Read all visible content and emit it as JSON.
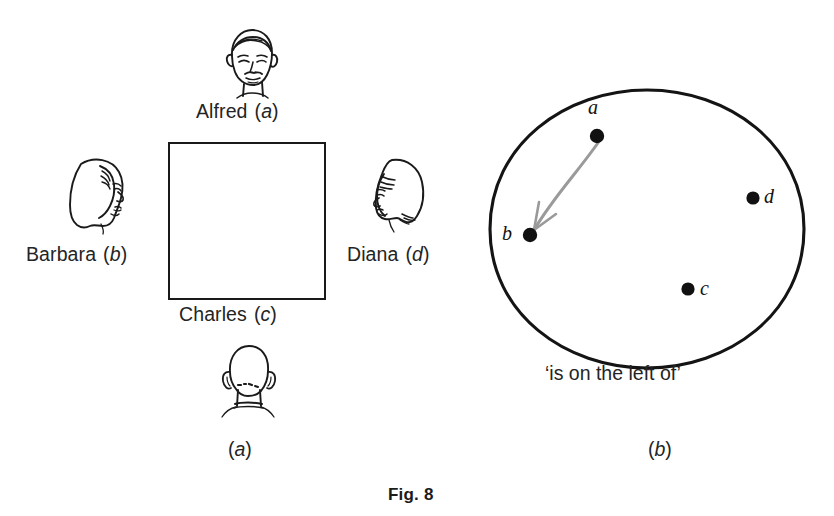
{
  "figure": {
    "caption": "Fig. 8",
    "panels": [
      {
        "id": "a",
        "letter": "(a)",
        "open_paren": "(",
        "symbol": "a",
        "close_paren": ")"
      },
      {
        "id": "b",
        "letter": "(b)",
        "open_paren": "(",
        "symbol": "b",
        "close_paren": ")"
      }
    ]
  },
  "panel_a": {
    "description": "four people seated around a square table",
    "table_shape": "square",
    "people": [
      {
        "name": "Alfred",
        "symbol": "a",
        "seat": "top",
        "name_text": "Alfred",
        "paren_open": "(",
        "paren_close": ")",
        "portrait": "face-front-male-icon"
      },
      {
        "name": "Barbara",
        "symbol": "b",
        "seat": "left",
        "name_text": "Barbara",
        "paren_open": "(",
        "paren_close": ")",
        "portrait": "face-profile-right-female-icon"
      },
      {
        "name": "Charles",
        "symbol": "c",
        "seat": "bottom",
        "name_text": "Charles",
        "paren_open": "(",
        "paren_close": ")",
        "portrait": "head-back-male-icon"
      },
      {
        "name": "Diana",
        "symbol": "d",
        "seat": "right",
        "name_text": "Diana",
        "paren_open": "(",
        "paren_close": ")",
        "portrait": "face-profile-left-female-icon"
      }
    ]
  },
  "panel_b": {
    "description": "relation diagram inside an oval",
    "relation_label": "‘is on the left of’",
    "nodes": [
      {
        "id": "a",
        "label": "a",
        "x": 597,
        "y": 136,
        "label_x": 592,
        "label_y": 108
      },
      {
        "id": "b",
        "label": "b",
        "x": 530,
        "y": 235,
        "label_x": 509,
        "label_y": 231
      },
      {
        "id": "d",
        "label": "d",
        "x": 753,
        "y": 198,
        "label_x": 766,
        "label_y": 195
      },
      {
        "id": "c",
        "label": "c",
        "x": 688,
        "y": 289,
        "label_x": 703,
        "label_y": 287
      }
    ],
    "arrows": [
      {
        "from": "a",
        "to": "b",
        "color": "#9a9a9a",
        "style": "curved-arrow"
      }
    ]
  },
  "colors": {
    "ink": "#1a1a1a",
    "text": "#242424",
    "arrow": "#9a9a9a",
    "paper": "#ffffff"
  }
}
